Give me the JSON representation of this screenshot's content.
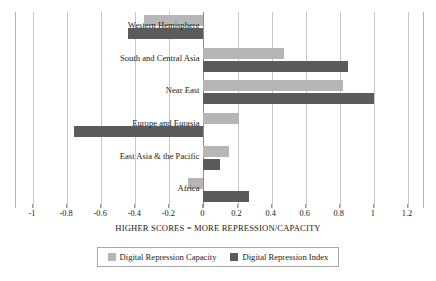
{
  "chart_data": {
    "type": "bar",
    "orientation": "horizontal",
    "title": "",
    "xlabel": "HIGHER SCORES = MORE REPRESSION/CAPACITY",
    "ylabel": "",
    "xlim": [
      -1.1,
      1.3
    ],
    "xticks": [
      "-1",
      "-0.8",
      "-0.6",
      "-0.4",
      "-0.2",
      "0",
      "0.2",
      "0.4",
      "0.6",
      "0.8",
      "1",
      "1.2"
    ],
    "xtick_values": [
      -1,
      -0.8,
      -0.6,
      -0.4,
      -0.2,
      0,
      0.2,
      0.4,
      0.6,
      0.8,
      1,
      1.2
    ],
    "grid": true,
    "legend_position": "bottom",
    "categories": [
      "Western Hemisphere",
      "South and Central Asia",
      "Near East",
      "Europe and Eurasia",
      "East Asia & the Pacific",
      "Africa"
    ],
    "series": [
      {
        "name": "Digital Repression Capacity",
        "color": "#b6b6b6",
        "values": [
          -0.35,
          0.47,
          0.82,
          0.21,
          0.15,
          -0.09
        ]
      },
      {
        "name": "Digital Repression Index",
        "color": "#5b5b5b",
        "values": [
          -0.44,
          0.85,
          1.0,
          -0.76,
          0.1,
          0.27
        ]
      }
    ]
  },
  "legend": {
    "entries": [
      {
        "label": "Digital Repression Capacity",
        "color": "#b6b6b6"
      },
      {
        "label": "Digital Repression Index",
        "color": "#5b5b5b"
      }
    ]
  }
}
